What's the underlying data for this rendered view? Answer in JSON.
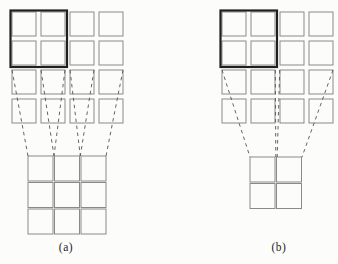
{
  "figure": {
    "colors": {
      "background": "#fcfcfb",
      "grid_stroke": "#8a8a8a",
      "bold_stroke": "#1f1f1f",
      "dash_stroke": "#545454"
    },
    "panels": [
      {
        "id": "a",
        "label": "(a)",
        "top_grid": {
          "rows": 4,
          "cols": 4,
          "x": 12,
          "y": 12,
          "cell": 24,
          "pitch": 29
        },
        "bold_region": {
          "x": 10.5,
          "y": 10.5,
          "w": 56.5,
          "h": 56.5
        },
        "bottom_grid": {
          "rows": 3,
          "cols": 3,
          "x": 28,
          "y": 156,
          "cell": 25,
          "pitch": 26.5
        },
        "conn_y1": 70,
        "conn_y2": 156,
        "connections": [
          {
            "x1": 12,
            "x2": 28
          },
          {
            "x1": 65,
            "x2": 54
          },
          {
            "x1": 41,
            "x2": 54
          },
          {
            "x1": 94,
            "x2": 80.3
          },
          {
            "x1": 70,
            "x2": 80.3
          },
          {
            "x1": 123,
            "x2": 106
          }
        ]
      },
      {
        "id": "b",
        "label": "(b)",
        "top_grid": {
          "rows": 4,
          "cols": 4,
          "x": 222,
          "y": 12,
          "cell": 24,
          "pitch": 29
        },
        "bold_region": {
          "x": 220.5,
          "y": 10.5,
          "w": 56.5,
          "h": 56.5
        },
        "bottom_grid": {
          "rows": 2,
          "cols": 2,
          "x": 250,
          "y": 157,
          "cell": 25,
          "pitch": 26.5
        },
        "conn_y1": 70,
        "conn_y2": 157,
        "connections": [
          {
            "x1": 222,
            "x2": 250
          },
          {
            "x1": 275.3,
            "x2": 275.8
          },
          {
            "x1": 279.7,
            "x2": 277.2
          },
          {
            "x1": 333,
            "x2": 302
          }
        ]
      }
    ]
  }
}
